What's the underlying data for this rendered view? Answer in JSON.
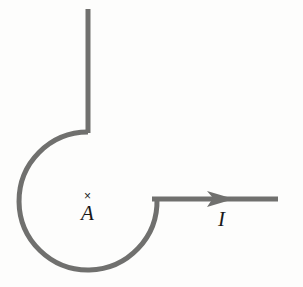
{
  "figure": {
    "type": "physics-circuit-diagram",
    "background_color": "#fdfdfc",
    "wire_color": "#70706e",
    "label_color": "#181818",
    "stroke_width": 5
  },
  "labels": {
    "field_point_marker": "×",
    "field_point_name": "A",
    "current_symbol": "I"
  },
  "geometry": {
    "loop": {
      "center_x": 88,
      "center_y": 201,
      "radius": 69,
      "gap_description": "open between the horizontal lead on the right and the vertical lead at the top"
    },
    "vertical_lead": {
      "x": 88,
      "y_top": 9,
      "y_bottom": 133
    },
    "horizontal_lead": {
      "y": 199,
      "x_left": 152,
      "x_right": 278
    },
    "arrow": {
      "tip_x": 233,
      "tip_y": 199,
      "direction": "right"
    }
  }
}
